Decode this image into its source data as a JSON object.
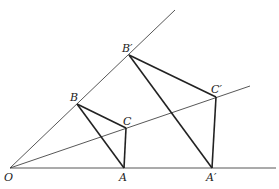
{
  "diagram": {
    "stroke_color": "#333333",
    "background": "#ffffff",
    "points": {
      "O": {
        "label": "O",
        "x": 10,
        "y": 168
      },
      "A": {
        "label": "A",
        "x": 124,
        "y": 168
      },
      "B": {
        "label": "B",
        "x": 77,
        "y": 104
      },
      "C": {
        "label": "C",
        "x": 126,
        "y": 128
      },
      "A_prime": {
        "label": "A′",
        "x": 212,
        "y": 168
      },
      "B_prime": {
        "label": "B′",
        "x": 129,
        "y": 55
      },
      "C_prime": {
        "label": "C′",
        "x": 216,
        "y": 97
      }
    },
    "rays": [
      {
        "name": "ray-OA",
        "from": "O",
        "to": [
          276,
          168
        ]
      },
      {
        "name": "ray-OB",
        "from": "O",
        "to": [
          175,
          10
        ]
      },
      {
        "name": "ray-OC",
        "from": "O",
        "to": [
          250,
          86
        ]
      }
    ],
    "triangles": [
      {
        "name": "triangle-ABC",
        "vertices": [
          "A",
          "B",
          "C"
        ]
      },
      {
        "name": "triangle-A-prime-B-prime-C-prime",
        "vertices": [
          "A_prime",
          "B_prime",
          "C_prime"
        ]
      }
    ]
  }
}
